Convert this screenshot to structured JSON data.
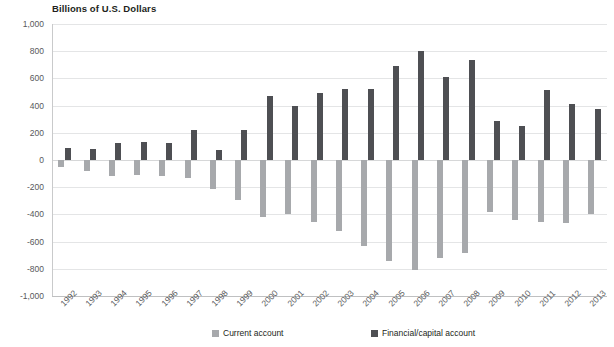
{
  "chart_data": {
    "type": "bar",
    "title": "Billions of U.S. Dollars",
    "subtitle": "",
    "xlabel": "",
    "ylabel": "Billions of U.S. Dollars",
    "ylim": [
      -1000,
      1000
    ],
    "ytick_step": 200,
    "ytick_labels": [
      "1,000",
      "800",
      "600",
      "400",
      "200",
      "0",
      "-200",
      "-400",
      "-600",
      "-800",
      "-1,000"
    ],
    "ytick_values": [
      1000,
      800,
      600,
      400,
      200,
      0,
      -200,
      -400,
      -600,
      -800,
      -1000
    ],
    "grid": true,
    "legend_position": "bottom",
    "categories": [
      "1992",
      "1993",
      "1994",
      "1995",
      "1996",
      "1997",
      "1998",
      "1999",
      "2000",
      "2001",
      "2002",
      "2003",
      "2004",
      "2005",
      "2006",
      "2007",
      "2008",
      "2009",
      "2010",
      "2011",
      "2012",
      "2013"
    ],
    "series": [
      {
        "name": "Current account",
        "color": "#a7a9ac",
        "values": [
          -50,
          -82,
          -118,
          -110,
          -120,
          -136,
          -210,
          -297,
          -416,
          -397,
          -459,
          -521,
          -634,
          -745,
          -807,
          -719,
          -687,
          -381,
          -444,
          -459,
          -461,
          -400
        ]
      },
      {
        "name": "Financial/capital account",
        "color": "#4e4f53",
        "values": [
          90,
          78,
          125,
          130,
          125,
          221,
          70,
          217,
          472,
          400,
          495,
          520,
          521,
          690,
          798,
          609,
          733,
          287,
          249,
          518,
          412,
          376
        ]
      }
    ]
  },
  "legend": {
    "items": [
      {
        "label": "Current account",
        "swatch": "current"
      },
      {
        "label": "Financial/capital account",
        "swatch": "financial"
      }
    ]
  },
  "colors": {
    "current_account": "#a7a9ac",
    "financial_capital_account": "#4e4f53",
    "gridline": "#e4e5e6",
    "axis": "#c9cacb",
    "text": "#58595b",
    "title": "#231f20"
  }
}
